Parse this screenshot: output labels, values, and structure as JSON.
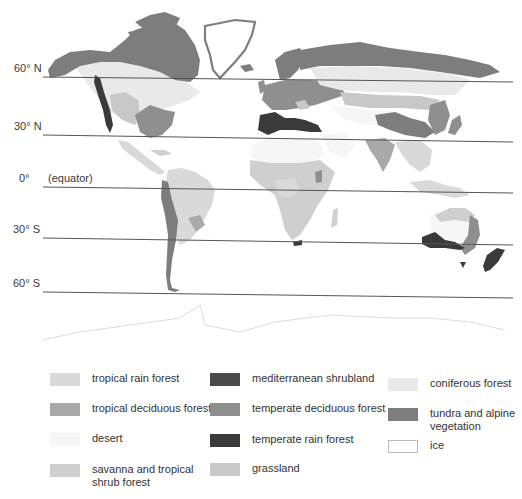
{
  "latitudes": [
    {
      "label": "60° N",
      "y_left": 77,
      "y_right": 82
    },
    {
      "label": "30° N",
      "y_left": 135,
      "y_right": 142
    },
    {
      "label": "0°",
      "note": "(equator)",
      "y_left": 187,
      "y_right": 193
    },
    {
      "label": "30° S",
      "y_left": 238,
      "y_right": 245
    },
    {
      "label": "60° S",
      "y_left": 292,
      "y_right": 298
    }
  ],
  "colors": {
    "tropical_rain_forest": "#d9d9d9",
    "tropical_deciduous_forest": "#a9a9a9",
    "desert": "#f6f6f6",
    "savanna": "#cfcfcf",
    "mediterranean": "#4a4a4a",
    "temperate_deciduous": "#8f8f8f",
    "temperate_rain": "#3a3a3a",
    "grassland": "#c8c8c8",
    "coniferous": "#e9e9e9",
    "tundra": "#7d7d7d",
    "ice": "#ffffff",
    "line": "#555555"
  },
  "legend": {
    "items": [
      {
        "key": "tropical_rain_forest",
        "label": "tropical rain forest",
        "color": "#d9d9d9"
      },
      {
        "key": "tropical_deciduous_forest",
        "label": "tropical deciduous forest",
        "color": "#a9a9a9"
      },
      {
        "key": "desert",
        "label": "desert",
        "color": "#f6f6f6"
      },
      {
        "key": "savanna",
        "label": "savanna and tropical shrub forest",
        "color": "#cfcfcf"
      },
      {
        "key": "mediterranean",
        "label": "mediterranean shrubland",
        "color": "#4a4a4a"
      },
      {
        "key": "temperate_deciduous",
        "label": "temperate deciduous forest",
        "color": "#8f8f8f"
      },
      {
        "key": "temperate_rain",
        "label": "temperate rain forest",
        "color": "#3a3a3a"
      },
      {
        "key": "grassland",
        "label": "grassland",
        "color": "#c8c8c8"
      },
      {
        "key": "coniferous",
        "label": "coniferous forest",
        "color": "#e9e9e9"
      },
      {
        "key": "tundra",
        "label": "tundra and alpine vegetation",
        "color": "#7d7d7d"
      },
      {
        "key": "ice",
        "label": "ice",
        "color": "#ffffff"
      }
    ]
  }
}
